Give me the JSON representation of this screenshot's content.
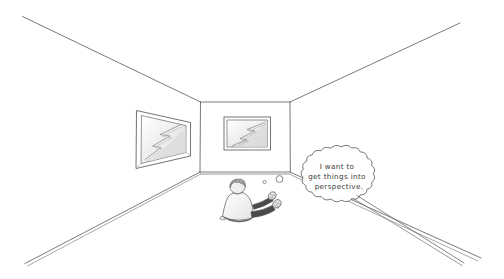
{
  "illustration": {
    "title": "One-point perspective room cartoon",
    "style": "hand-drawn pencil sketch",
    "background_color": "#ffffff",
    "line_color": "#555555",
    "shade_color": "#d9d9d9"
  },
  "room": {
    "name": "empty room in one-point perspective",
    "back_wall_label": "back wall",
    "left_wall_label": "left wall",
    "right_wall_label": "right wall",
    "ceiling_label": "ceiling",
    "floor_label": "floor"
  },
  "artworks": [
    {
      "name": "left-wall-picture",
      "position": "left wall",
      "orientation": "foreshortened in perspective",
      "content": "zigzag lightning-bolt shape"
    },
    {
      "name": "back-wall-picture",
      "position": "back wall",
      "orientation": "frontal, undistorted",
      "content": "zigzag lightning-bolt shape"
    }
  ],
  "character": {
    "name": "seated person",
    "pose": "sitting on the floor, seen from behind, legs outstretched",
    "hair_color": "#8a8a8a",
    "shirt_color": "#f2f2f2"
  },
  "thought": {
    "speaker": "seated person",
    "lines": [
      "I want to",
      "get things into",
      "perspective."
    ],
    "full_text": "I want to get things into perspective.",
    "bubble_type": "cloud thought bubble",
    "trail_dots": 2
  }
}
